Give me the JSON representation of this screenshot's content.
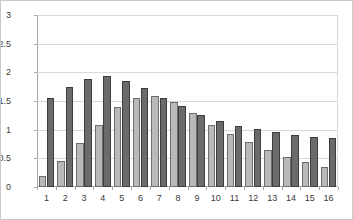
{
  "chart_data": {
    "type": "bar",
    "title": "",
    "subtitle": "",
    "xlabel": "",
    "ylabel": "",
    "ylim": [
      0,
      3
    ],
    "yticks": [
      "0",
      "0.5",
      "1",
      "1.5",
      "2",
      "2.5",
      "3"
    ],
    "ytick_values": [
      0,
      0.5,
      1,
      1.5,
      2,
      2.5,
      3
    ],
    "grid": true,
    "legend": "none",
    "categories": [
      "1",
      "2",
      "3",
      "4",
      "5",
      "6",
      "7",
      "8",
      "9",
      "10",
      "11",
      "12",
      "13",
      "14",
      "15",
      "16"
    ],
    "series": [
      {
        "name": "series-a",
        "color": "#b9b9b9",
        "values": [
          0.19,
          0.45,
          0.76,
          1.09,
          1.39,
          1.55,
          1.58,
          1.48,
          1.29,
          1.09,
          0.93,
          0.78,
          0.64,
          0.53,
          0.44,
          0.35
        ]
      },
      {
        "name": "series-b",
        "color": "#6b6b6b",
        "values": [
          1.55,
          1.74,
          1.89,
          1.93,
          1.85,
          1.72,
          1.55,
          1.42,
          1.25,
          1.15,
          1.06,
          1.01,
          0.96,
          0.91,
          0.88,
          0.86
        ]
      }
    ]
  },
  "colors": {
    "series_a": "#b9b9b9",
    "series_b": "#6b6b6b",
    "grid": "#d8d8d8",
    "axis": "#a6a6a6",
    "text": "#3a3a3a",
    "frame": "#c9c9c9",
    "background": "#ffffff"
  }
}
